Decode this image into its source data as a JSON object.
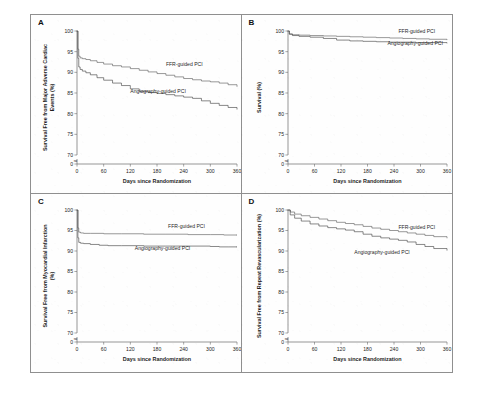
{
  "figure": {
    "panels": [
      {
        "letter": "A",
        "ylabel_line1": "Survival Free from Major Adverse Cardiac",
        "ylabel_line2": "Events (%)",
        "xlabel": "Days since Randomization"
      },
      {
        "letter": "B",
        "ylabel_line1": "Survival (%)",
        "ylabel_line2": "",
        "xlabel": "Days since Randomization"
      },
      {
        "letter": "C",
        "ylabel_line1": "Survival Free from Myocardial Infarction",
        "ylabel_line2": "(%)",
        "xlabel": "Days since Randomization"
      },
      {
        "letter": "D",
        "ylabel_line1": "Survival Free from Repeat Revascularization (%)",
        "ylabel_line2": "",
        "xlabel": "Days since Randomization"
      }
    ],
    "axis_break_symbol": "≈"
  },
  "chart_data": [
    {
      "type": "line",
      "panel": "A",
      "title": "Survival Free from Major Adverse Cardiac Events",
      "xlabel": "Days since Randomization",
      "ylabel": "Survival Free from Major Adverse Cardiac Events (%)",
      "xlim": [
        0,
        360
      ],
      "ylim": [
        70,
        100
      ],
      "xticks": [
        0,
        60,
        120,
        180,
        240,
        300,
        360
      ],
      "yticks": [
        70,
        75,
        80,
        85,
        90,
        95,
        100
      ],
      "y_axis_break": true,
      "y_axis_break_to": 0,
      "grid": false,
      "legend": "inline-labels",
      "series": [
        {
          "name": "FFR-guided PCI",
          "color": "#5a5a5a",
          "label_x": 200,
          "label_y": 91.6,
          "x": [
            0,
            2,
            4,
            7,
            12,
            20,
            30,
            45,
            60,
            80,
            100,
            120,
            140,
            160,
            180,
            200,
            220,
            240,
            260,
            280,
            300,
            320,
            340,
            360
          ],
          "y": [
            100,
            95.6,
            93.9,
            93.5,
            93.3,
            93.1,
            92.8,
            92.4,
            92.0,
            91.6,
            91.3,
            90.9,
            90.5,
            90.1,
            89.7,
            89.3,
            88.9,
            88.5,
            88.2,
            87.9,
            87.7,
            87.4,
            87.0,
            86.6
          ]
        },
        {
          "name": "Angiography-guided PCI",
          "color": "#404040",
          "label_x": 120,
          "label_y": 85.0,
          "x": [
            0,
            2,
            4,
            7,
            12,
            20,
            30,
            45,
            60,
            80,
            100,
            120,
            140,
            160,
            180,
            200,
            220,
            240,
            260,
            280,
            300,
            320,
            340,
            360
          ],
          "y": [
            100,
            93.4,
            91.3,
            90.7,
            90.3,
            89.9,
            89.4,
            88.7,
            88.1,
            87.4,
            86.8,
            86.0,
            85.4,
            85.1,
            84.9,
            84.6,
            84.3,
            84.0,
            83.7,
            83.1,
            82.5,
            82.0,
            81.5,
            81.1
          ]
        }
      ]
    },
    {
      "type": "line",
      "panel": "B",
      "title": "Survival",
      "xlabel": "Days since Randomization",
      "ylabel": "Survival (%)",
      "xlim": [
        0,
        360
      ],
      "ylim": [
        70,
        100
      ],
      "xticks": [
        0,
        60,
        120,
        180,
        240,
        300,
        360
      ],
      "yticks": [
        70,
        75,
        80,
        85,
        90,
        95,
        100
      ],
      "y_axis_break": true,
      "y_axis_break_to": 0,
      "grid": false,
      "legend": "inline-labels",
      "series": [
        {
          "name": "FFR-guided PCI",
          "color": "#5a5a5a",
          "label_x": 250,
          "label_y": 99.4,
          "x": [
            0,
            3,
            10,
            25,
            50,
            80,
            110,
            140,
            170,
            200,
            230,
            260,
            290,
            320,
            360
          ],
          "y": [
            100,
            99.3,
            99.1,
            99.0,
            98.9,
            98.8,
            98.7,
            98.6,
            98.5,
            98.4,
            98.3,
            98.2,
            98.1,
            98.0,
            97.9
          ]
        },
        {
          "name": "Angiography-guided PCI",
          "color": "#404040",
          "label_x": 225,
          "label_y": 96.6,
          "x": [
            0,
            3,
            10,
            25,
            50,
            80,
            110,
            140,
            170,
            200,
            230,
            260,
            290,
            320,
            360
          ],
          "y": [
            100,
            99.2,
            98.9,
            98.7,
            98.5,
            98.2,
            97.8,
            97.6,
            97.5,
            97.4,
            97.3,
            97.3,
            97.2,
            97.2,
            97.1
          ]
        }
      ]
    },
    {
      "type": "line",
      "panel": "C",
      "title": "Survival Free from Myocardial Infarction",
      "xlabel": "Days since Randomization",
      "ylabel": "Survival Free from Myocardial Infarction (%)",
      "xlim": [
        0,
        360
      ],
      "ylim": [
        70,
        100
      ],
      "xticks": [
        0,
        60,
        120,
        180,
        240,
        300,
        360
      ],
      "yticks": [
        70,
        75,
        80,
        85,
        90,
        95,
        100
      ],
      "y_axis_break": true,
      "y_axis_break_to": 0,
      "grid": false,
      "legend": "inline-labels",
      "series": [
        {
          "name": "FFR-guided PCI",
          "color": "#5a5a5a",
          "label_x": 205,
          "label_y": 95.6,
          "x": [
            0,
            2,
            4,
            8,
            15,
            30,
            60,
            100,
            150,
            200,
            250,
            300,
            330,
            360
          ],
          "y": [
            100,
            95.6,
            94.6,
            94.4,
            94.3,
            94.3,
            94.2,
            94.2,
            94.1,
            94.1,
            94.0,
            94.0,
            93.9,
            93.9
          ]
        },
        {
          "name": "Angiography-guided PCI",
          "color": "#404040",
          "label_x": 130,
          "label_y": 90.3,
          "x": [
            0,
            2,
            4,
            8,
            15,
            30,
            50,
            70,
            100,
            150,
            200,
            250,
            300,
            320,
            340,
            360
          ],
          "y": [
            100,
            93.2,
            92.1,
            91.9,
            91.8,
            91.6,
            91.4,
            91.3,
            91.3,
            91.2,
            91.2,
            91.2,
            91.1,
            91.0,
            91.0,
            91.0
          ]
        }
      ]
    },
    {
      "type": "line",
      "panel": "D",
      "title": "Survival Free from Repeat Revascularization",
      "xlabel": "Days since Randomization",
      "ylabel": "Survival Free from Repeat Revascularization (%)",
      "xlim": [
        0,
        360
      ],
      "ylim": [
        70,
        100
      ],
      "xticks": [
        0,
        60,
        120,
        180,
        240,
        300,
        360
      ],
      "yticks": [
        70,
        75,
        80,
        85,
        90,
        95,
        100
      ],
      "y_axis_break": true,
      "y_axis_break_to": 0,
      "grid": false,
      "legend": "inline-labels",
      "series": [
        {
          "name": "FFR-guided PCI",
          "color": "#5a5a5a",
          "label_x": 250,
          "label_y": 95.3,
          "x": [
            0,
            5,
            15,
            30,
            50,
            70,
            90,
            110,
            130,
            150,
            170,
            190,
            210,
            230,
            250,
            270,
            290,
            310,
            330,
            360
          ],
          "y": [
            100,
            99.5,
            99.0,
            98.6,
            98.2,
            97.8,
            97.4,
            97.0,
            96.7,
            96.4,
            96.0,
            95.6,
            95.3,
            95.0,
            94.7,
            94.4,
            94.1,
            93.8,
            93.5,
            93.2
          ]
        },
        {
          "name": "Angiography-guided PCI",
          "color": "#404040",
          "label_x": 150,
          "label_y": 89.3,
          "x": [
            0,
            5,
            15,
            30,
            50,
            70,
            90,
            110,
            130,
            150,
            170,
            190,
            210,
            230,
            250,
            270,
            290,
            310,
            330,
            360
          ],
          "y": [
            100,
            98.8,
            98.0,
            97.3,
            96.6,
            96.1,
            95.7,
            95.4,
            95.1,
            94.7,
            94.1,
            93.6,
            93.2,
            92.9,
            92.6,
            92.2,
            91.6,
            91.1,
            90.6,
            90.2
          ]
        }
      ]
    }
  ]
}
